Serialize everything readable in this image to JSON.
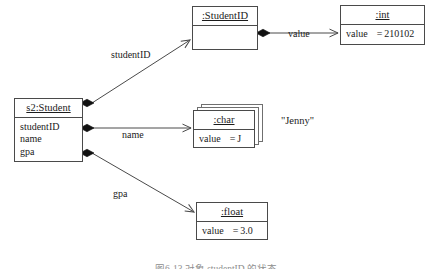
{
  "diagram": {
    "type": "uml-object-diagram",
    "title": "",
    "caption": "图6-13 对象 studentID 的状态",
    "colors": {
      "stroke": "#4a4a4a",
      "ghost_stroke": "#6f6f6f",
      "text": "#1b1b1b",
      "background": "#ffffff",
      "caption_text": "#8e8e8e"
    },
    "objects": [
      {
        "id": "student",
        "header": "s2:Student",
        "underlined": true,
        "compartment_kind": "attributes",
        "attributes": [
          "studentID",
          "name",
          "gpa"
        ],
        "slots": [],
        "stacked": false,
        "x": 14,
        "y": 98,
        "width": 69,
        "height": 64
      },
      {
        "id": "studentid",
        "header": ":StudentID",
        "underlined": true,
        "compartment_kind": "empty",
        "attributes": [],
        "slots": [],
        "stacked": false,
        "x": 192,
        "y": 6,
        "width": 66,
        "height": 44
      },
      {
        "id": "int",
        "header": ":int",
        "underlined": true,
        "compartment_kind": "slots",
        "attributes": [],
        "slots": [
          {
            "name": "value",
            "eq": "=",
            "value": "210102"
          }
        ],
        "stacked": false,
        "x": 340,
        "y": 5,
        "width": 85,
        "height": 40
      },
      {
        "id": "char",
        "header": ":char",
        "underlined": true,
        "compartment_kind": "slots",
        "attributes": [],
        "slots": [
          {
            "name": "value",
            "eq": "=",
            "value": "J"
          }
        ],
        "stacked": true,
        "x": 193,
        "y": 110,
        "width": 62,
        "height": 38
      },
      {
        "id": "float",
        "header": ":float",
        "underlined": true,
        "compartment_kind": "slots",
        "attributes": [],
        "slots": [
          {
            "name": "value",
            "eq": "=",
            "value": "3.0"
          }
        ],
        "stacked": false,
        "x": 196,
        "y": 202,
        "width": 72,
        "height": 38
      }
    ],
    "links": [
      {
        "id": "link-studentid",
        "label": "studentID",
        "from": "student",
        "to": "studentid",
        "source_decoration": "filled-diamond",
        "target_decoration": "open-arrow"
      },
      {
        "id": "link-name",
        "label": "name",
        "from": "student",
        "to": "char",
        "source_decoration": "filled-diamond",
        "target_decoration": "open-arrow"
      },
      {
        "id": "link-gpa",
        "label": "gpa",
        "from": "student",
        "to": "float",
        "source_decoration": "filled-diamond",
        "target_decoration": "open-arrow"
      },
      {
        "id": "link-value",
        "label": "value",
        "from": "studentid",
        "to": "int",
        "source_decoration": "filled-diamond",
        "target_decoration": "open-arrow"
      }
    ],
    "annotations": [
      {
        "id": "jenny-value",
        "text": "\"Jenny\"",
        "x": 281,
        "y": 116
      }
    ]
  }
}
